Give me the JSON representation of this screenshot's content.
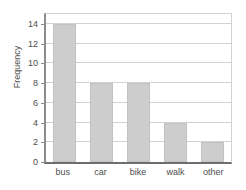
{
  "chart_data": {
    "type": "bar",
    "title": "",
    "xlabel": "",
    "ylabel": "Frequency",
    "categories": [
      "bus",
      "car",
      "bike",
      "walk",
      "other"
    ],
    "values": [
      14,
      8,
      8,
      4,
      2
    ],
    "ylim": [
      0,
      15
    ],
    "yticks": [
      0,
      2,
      4,
      6,
      8,
      10,
      12,
      14
    ],
    "ytick_labels": [
      "0",
      "2",
      "4",
      "6",
      "8",
      "10",
      "12",
      "14"
    ],
    "grid": true,
    "grid_axis": "y",
    "legend": false,
    "legend_position": "none",
    "series": [
      {
        "name": "Frequency",
        "values": [
          14,
          8,
          8,
          4,
          2
        ]
      }
    ],
    "colors": {
      "bar_fill": "#cdcdcd",
      "bar_edge": "#c2c2c2",
      "gridline": "#d2d2d2",
      "axis": "#6e6e6e",
      "text": "#4d4d4d",
      "background": "#ffffff"
    }
  }
}
